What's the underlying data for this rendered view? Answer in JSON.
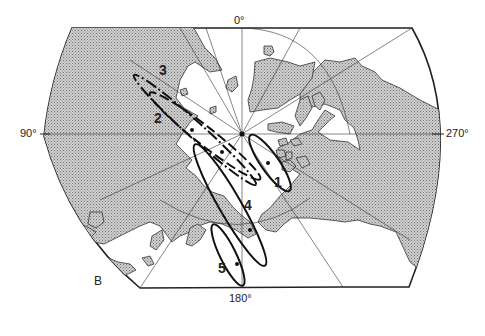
{
  "map": {
    "panel_label": "B",
    "axis_labels": {
      "top": "0°",
      "left": "90°",
      "right": "270°",
      "bottom": "180°"
    },
    "ellipses": [
      {
        "id": "1",
        "label": "1",
        "style": "solid"
      },
      {
        "id": "2",
        "label": "2",
        "style": "dashed"
      },
      {
        "id": "3",
        "label": "3",
        "style": "dash-dot"
      },
      {
        "id": "4",
        "label": "4",
        "style": "solid"
      },
      {
        "id": "5",
        "label": "5",
        "style": "solid"
      }
    ],
    "colors": {
      "land": "#b8b8b8",
      "ocean": "#ffffff",
      "line": "#222222"
    }
  }
}
